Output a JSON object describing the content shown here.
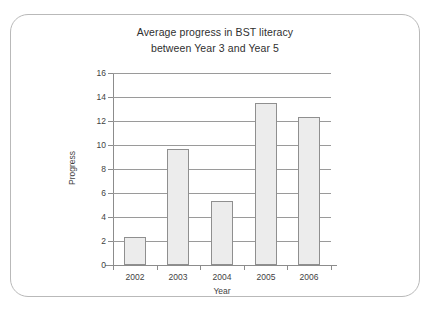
{
  "chart_data": {
    "type": "bar",
    "title": "Average progress in BST literacy between Year 3 and Year 5",
    "title_lines": [
      "Average progress in BST literacy",
      "between Year 3 and Year 5"
    ],
    "categories": [
      "2002",
      "2003",
      "2004",
      "2005",
      "2006"
    ],
    "values": [
      2.35,
      9.7,
      5.35,
      13.5,
      12.3
    ],
    "xlabel": "Year",
    "ylabel": "Progress",
    "ylim": [
      0,
      16
    ],
    "y_ticks": [
      0,
      2,
      4,
      6,
      8,
      10,
      12,
      14,
      16
    ],
    "y_tick_labels": [
      "0",
      "2",
      "4",
      "6",
      "8",
      "10",
      "12",
      "14",
      "16"
    ],
    "grid": true,
    "legend": "none",
    "bar_fill_color": "#ececec",
    "bar_border_color": "#8f8f8f",
    "axis_color": "#8c8c8c",
    "gridline_color": "#9a9a9a",
    "frame_color": "#b9b9b9",
    "background_color": "#ffffff"
  }
}
